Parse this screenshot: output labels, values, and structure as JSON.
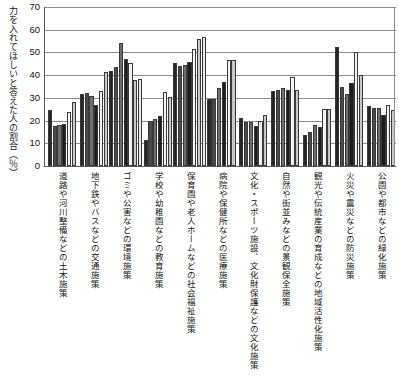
{
  "chart": {
    "y_axis_title": "力を入れてほしいと答えた人の割合（％）",
    "y_ticks": [
      0,
      10,
      20,
      30,
      40,
      50,
      60,
      70
    ],
    "ylim": [
      0,
      70
    ]
  },
  "chart_data": {
    "type": "bar",
    "title": "",
    "xlabel": "",
    "ylabel": "力を入れてほしいと答えた人の割合（％）",
    "ylim": [
      0,
      70
    ],
    "grid": true,
    "legend": "none",
    "categories": [
      "道路や河川整備などの土木施策",
      "地下鉄やバスなどの交通施策",
      "ゴミや公害などの環境施策",
      "学校や幼稚園などの教育施策",
      "保育園や老人ホームなどの社会福祉施策",
      "病院や保健所などの医療施策",
      "文化・スポーツ施設、文化財保護などの文化施策",
      "自然や街並みなどの景観保全施策",
      "観光や伝統産業の育成などの地域活性化施策",
      "火災や震災などの防災施策",
      "公園や都市などの緑化施策"
    ],
    "series": [
      {
        "name": "系列1",
        "shade": "#262626",
        "values": [
          24.5,
          31.8,
          42.0,
          11.5,
          45.5,
          29.5,
          21.0,
          33.0,
          13.5,
          52.5,
          26.5
        ]
      },
      {
        "name": "系列2",
        "shade": "#4a4a4a",
        "values": [
          17.5,
          32.0,
          43.5,
          20.0,
          44.0,
          29.5,
          19.5,
          33.5,
          15.0,
          35.0,
          25.5
        ]
      },
      {
        "name": "系列3",
        "shade": "#6e6e6e",
        "values": [
          18.0,
          31.0,
          54.0,
          20.5,
          44.5,
          34.5,
          19.5,
          34.5,
          18.0,
          31.5,
          25.5
        ]
      },
      {
        "name": "系列4",
        "shade": "#1c1c1c",
        "values": [
          18.5,
          27.0,
          47.0,
          22.0,
          46.0,
          37.0,
          17.5,
          33.5,
          17.0,
          36.5,
          22.5
        ]
      },
      {
        "name": "系列5",
        "shade": "#f2f2f2",
        "values": [
          24.0,
          33.0,
          45.5,
          32.5,
          51.5,
          46.5,
          20.0,
          39.0,
          25.0,
          50.0,
          27.0
        ]
      },
      {
        "name": "系列6",
        "shade": "#c8c8c8",
        "values": [
          28.0,
          41.5,
          38.0,
          30.5,
          56.0,
          46.5,
          22.5,
          33.5,
          25.0,
          40.0,
          24.5
        ]
      },
      {
        "name": "系列7",
        "shade": "#e8e8e8",
        "values": [
          0,
          0,
          38.5,
          0,
          57.0,
          0,
          0,
          0,
          0,
          0,
          0
        ]
      }
    ]
  }
}
